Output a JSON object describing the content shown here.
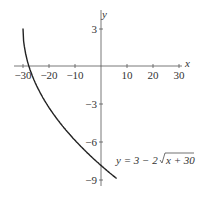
{
  "chart_data": {
    "type": "line",
    "title": "",
    "xlabel": "x",
    "ylabel": "y",
    "xlim": [
      -30,
      30
    ],
    "ylim": [
      -9,
      3
    ],
    "x_ticks": [
      -30,
      -20,
      -10,
      10,
      20,
      30
    ],
    "y_ticks": [
      3,
      -3,
      -6,
      -9
    ],
    "grid": false,
    "series": [
      {
        "name": "y = 3 - 2√(x + 30)",
        "equation": "y = 3 - 2*sqrt(x + 30)",
        "x": [
          -30,
          -29,
          -26,
          -21,
          -14,
          -5,
          6
        ],
        "y": [
          3,
          1,
          -1,
          -3,
          -5.27,
          -8.83,
          -9
        ]
      }
    ],
    "annotation": "y = 3 − 2√x + 30"
  },
  "labels": {
    "x_axis": "x",
    "y_axis": "y",
    "x_ticks": [
      "−30",
      "−20",
      "−10",
      "10",
      "20",
      "30"
    ],
    "y_ticks": [
      "3",
      "−3",
      "−6",
      "−9"
    ],
    "eq_prefix": "y = 3 − 2",
    "eq_radicand": "x + 30"
  }
}
